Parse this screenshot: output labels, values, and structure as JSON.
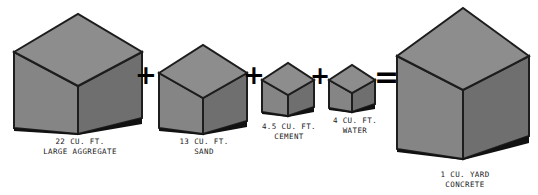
{
  "diagram": {
    "background_color": "#ffffff",
    "cube_top_color": "#8a8a8a",
    "cube_left_color": "#858585",
    "cube_right_color": "#6f6f6f",
    "cube_edge_color": "#1d1d1d",
    "shadow_color": "#111111",
    "text_color": "#1a1a1a",
    "operators": {
      "plus": "+",
      "equals": "="
    },
    "ingredients": [
      {
        "id": "large-aggregate",
        "amount": "22 CU. FT.",
        "material": "LARGE AGGREGATE",
        "cube_width": 132,
        "cube_height": 124
      },
      {
        "id": "sand",
        "amount": "13 CU. FT.",
        "material": "SAND",
        "cube_width": 92,
        "cube_height": 92
      },
      {
        "id": "cement",
        "amount": "4.5 CU. FT.",
        "material": "CEMENT",
        "cube_width": 56,
        "cube_height": 57
      },
      {
        "id": "water",
        "amount": "4 CU. FT.",
        "material": "WATER",
        "cube_width": 50,
        "cube_height": 51
      }
    ],
    "result": {
      "id": "concrete",
      "amount": "1 CU. YARD",
      "material": "CONCRETE",
      "cube_width": 135,
      "cube_height": 155
    }
  }
}
